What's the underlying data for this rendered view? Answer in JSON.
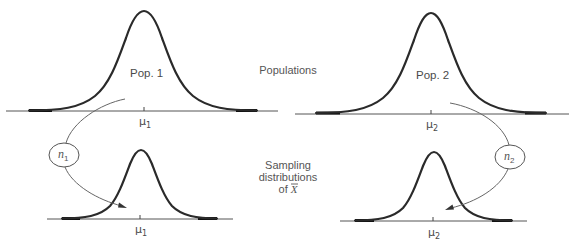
{
  "diagram": {
    "center_labels": {
      "populations": "Populations",
      "sampling_line1": "Sampling",
      "sampling_line2": "distributions",
      "sampling_line3_prefix": "of ",
      "sampling_line3_symbol": "X",
      "sampling_line3_overbar": true
    },
    "populations": [
      {
        "name": "Pop. 1",
        "mean_symbol": "μ",
        "mean_subscript": "1",
        "sample_size_symbol": "n",
        "sample_size_subscript": "1"
      },
      {
        "name": "Pop. 2",
        "mean_symbol": "μ",
        "mean_subscript": "2",
        "sample_size_symbol": "n",
        "sample_size_subscript": "2"
      }
    ],
    "sampling_distributions": [
      {
        "mean_symbol": "μ",
        "mean_subscript": "1"
      },
      {
        "mean_symbol": "μ",
        "mean_subscript": "2"
      }
    ],
    "colors": {
      "curve": "#2a2a2a",
      "axis": "#555555",
      "text": "#555555",
      "background": "#ffffff"
    }
  }
}
